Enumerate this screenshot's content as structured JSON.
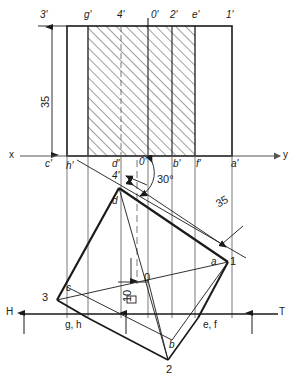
{
  "drawing": {
    "title": "orthographic-projection-worksheet",
    "colors": {
      "ink": "#1a1a1a",
      "thin": "#555555",
      "paper": "#ffffff"
    },
    "top_view_labels": [
      {
        "id": "t3p",
        "text": "3'",
        "x": 40,
        "y": 10
      },
      {
        "id": "tgp",
        "text": "g'",
        "x": 84,
        "y": 10
      },
      {
        "id": "t4p",
        "text": "4'",
        "x": 122,
        "y": 10
      },
      {
        "id": "t0p",
        "text": "0'",
        "x": 153,
        "y": 10
      },
      {
        "id": "t2p",
        "text": "2'",
        "x": 172,
        "y": 10
      },
      {
        "id": "tep",
        "text": "e'",
        "x": 195,
        "y": 10
      },
      {
        "id": "t1p",
        "text": "1'",
        "x": 228,
        "y": 10
      }
    ],
    "xy_line_labels": [
      {
        "id": "x-axis-label",
        "text": "x",
        "x": 10,
        "y": 150
      },
      {
        "id": "y-axis-label",
        "text": "y",
        "x": 283,
        "y": 150
      },
      {
        "id": "cp",
        "text": "c'",
        "x": 45,
        "y": 160
      },
      {
        "id": "hp",
        "text": "h'",
        "x": 67,
        "y": 162
      },
      {
        "id": "dp",
        "text": "d'",
        "x": 113,
        "y": 160
      },
      {
        "id": "z0p",
        "text": "0'",
        "x": 139,
        "y": 158
      },
      {
        "id": "bp",
        "text": "b'",
        "x": 174,
        "y": 160
      },
      {
        "id": "fp",
        "text": "f'",
        "x": 196,
        "y": 160
      },
      {
        "id": "ap",
        "text": "a'",
        "x": 231,
        "y": 160
      }
    ],
    "front_view_labels": [
      {
        "id": "p4p",
        "text": "4'",
        "x": 113,
        "y": 172
      },
      {
        "id": "pd",
        "text": "d",
        "x": 113,
        "y": 198
      },
      {
        "id": "pc",
        "text": "c",
        "x": 66,
        "y": 285
      },
      {
        "id": "p3",
        "text": "3",
        "x": 44,
        "y": 294
      },
      {
        "id": "p0",
        "text": "0",
        "x": 145,
        "y": 274
      },
      {
        "id": "pa",
        "text": "a",
        "x": 213,
        "y": 258
      },
      {
        "id": "p1",
        "text": "1",
        "x": 230,
        "y": 258
      },
      {
        "id": "pb",
        "text": "b",
        "x": 170,
        "y": 342
      },
      {
        "id": "p2",
        "text": "2",
        "x": 171,
        "y": 366
      }
    ],
    "ht_line_labels": [
      {
        "id": "h-label",
        "text": "H",
        "x": 7,
        "y": 307
      },
      {
        "id": "t-label",
        "text": "T",
        "x": 279,
        "y": 307
      },
      {
        "id": "gh-label",
        "text": "g, h",
        "x": 66,
        "y": 320
      },
      {
        "id": "ef-label",
        "text": "e, f",
        "x": 203,
        "y": 320
      }
    ],
    "dimensions": [
      {
        "id": "dim-35-vertical",
        "text": "35",
        "x": 41,
        "y": 108,
        "orient": "vertical"
      },
      {
        "id": "dim-35-oblique",
        "text": "35",
        "x": 221,
        "y": 192,
        "orient": "rot30"
      },
      {
        "id": "dim-10-vertical",
        "text": "10",
        "x": 125,
        "y": 302,
        "orient": "vertical"
      },
      {
        "id": "angle-30",
        "text": "30°",
        "x": 157,
        "y": 175,
        "orient": "plain"
      }
    ]
  }
}
